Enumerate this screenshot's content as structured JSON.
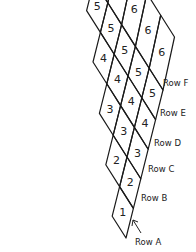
{
  "diagram": {
    "rows": [
      {
        "name": "Row A",
        "label": "Row A",
        "count": 1,
        "cell_value": "1"
      },
      {
        "name": "Row B",
        "label": "Row B",
        "count": 2,
        "cell_value": "2"
      },
      {
        "name": "Row C",
        "label": "Row C",
        "count": 3,
        "cell_value": "3"
      },
      {
        "name": "Row D",
        "label": "Row D",
        "count": 4,
        "cell_value": "4"
      },
      {
        "name": "Row E",
        "label": "Row E",
        "count": 5,
        "cell_value": "5"
      },
      {
        "name": "Row F",
        "label": "Row F",
        "count": 6,
        "cell_value": "6"
      }
    ],
    "row_a_pointer": "arrow-up-left",
    "stroke_color": "#1a1a1a",
    "background": "#ffffff"
  }
}
